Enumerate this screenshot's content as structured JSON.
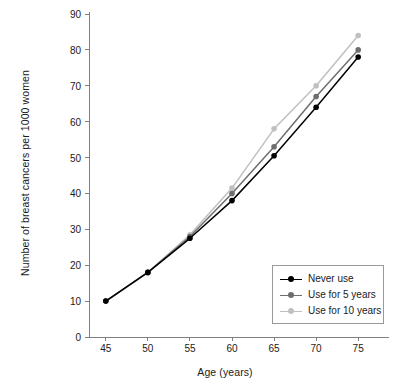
{
  "chart_data": {
    "type": "line",
    "title": "",
    "xlabel": "Age (years)",
    "ylabel": "Number of breast cancers per 1000 women",
    "x": [
      45,
      50,
      55,
      60,
      65,
      70,
      75
    ],
    "xtick_labels": [
      "45",
      "50",
      "55",
      "60",
      "65",
      "70",
      "75"
    ],
    "ytick_labels": [
      "0",
      "10",
      "20",
      "30",
      "40",
      "50",
      "60",
      "70",
      "80",
      "90"
    ],
    "ytick_values": [
      0,
      10,
      20,
      30,
      40,
      50,
      60,
      70,
      80,
      90
    ],
    "xlim": [
      43,
      77
    ],
    "ylim": [
      0,
      90
    ],
    "grid": false,
    "legend_position": "bottom-right",
    "series": [
      {
        "name": "Never use",
        "color": "#000000",
        "marker": "circle",
        "values": [
          10,
          18,
          27.5,
          38,
          50.5,
          64,
          78
        ]
      },
      {
        "name": "Use for 5 years",
        "color": "#6e6e6e",
        "marker": "circle",
        "values": [
          10,
          18,
          28,
          40,
          53,
          67,
          80
        ]
      },
      {
        "name": "Use for 10 years",
        "color": "#c0c0c0",
        "marker": "circle",
        "values": [
          10,
          18,
          28.5,
          41.5,
          58,
          70,
          84
        ]
      }
    ]
  },
  "axis": {
    "line_color": "#808080",
    "tick_color": "#808080"
  },
  "legend": {
    "border_color": "#9a9a9a",
    "items": [
      {
        "label": "Never use",
        "color": "#000000"
      },
      {
        "label": "Use for 5 years",
        "color": "#6e6e6e"
      },
      {
        "label": "Use for 10 years",
        "color": "#c0c0c0"
      }
    ]
  }
}
